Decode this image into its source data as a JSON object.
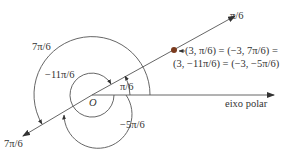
{
  "diagram": {
    "type": "polar-coordinates",
    "origin_label": "O",
    "polar_axis_label": "eixo polar",
    "ray_label_top": "π/6",
    "ray_label_bottom": "7π/6",
    "angle_labels": {
      "pi_over_6": "π/6",
      "seven_pi_over_6": "7π/6",
      "neg_eleven_pi_over_6": "−11π/6",
      "neg_five_pi_over_6": "−5π/6"
    },
    "point": {
      "label_line1": "(3, π/6) = (−3, 7π/6) =",
      "label_line2": "(3, −11π/6) = (−3, −5π/6)",
      "color": "#7a3b1e"
    },
    "colors": {
      "line": "#555555",
      "text": "#333333",
      "background": "#ffffff"
    }
  }
}
